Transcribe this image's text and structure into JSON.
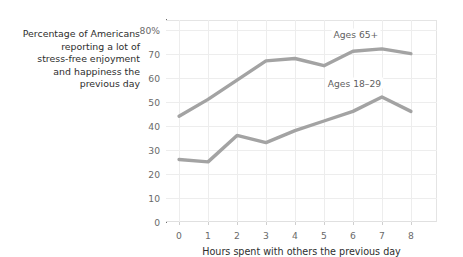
{
  "caption": "Percentage of Americans\nreporting a lot of\nstress-free enjoyment\nand happiness the\nprevious day",
  "axes": {
    "ylabel": "",
    "xlabel": "Hours spent with others the previous day",
    "yticks": [
      "0",
      "10",
      "20",
      "30",
      "40",
      "50",
      "60",
      "70",
      "80%"
    ],
    "xticks": [
      "0",
      "1",
      "2",
      "3",
      "4",
      "5",
      "6",
      "7",
      "8"
    ]
  },
  "annotations": {
    "series_65_label": "Ages 65+",
    "series_18_label": "Ages 18–29"
  },
  "colors": {
    "line": "#a3a3a3",
    "grid": "#ededed",
    "spine": "#6e6e6e",
    "text": "#2e2e2e",
    "tick_text": "#6a6a6a"
  },
  "chart_data": {
    "type": "line",
    "title": "",
    "subtitle": "",
    "xlabel": "Hours spent with others the previous day",
    "ylabel": "Percentage of Americans reporting a lot of stress-free enjoyment and happiness the previous day",
    "x": [
      0,
      1,
      2,
      3,
      4,
      5,
      6,
      7,
      8
    ],
    "xlim": [
      -0.45,
      8.9
    ],
    "ylim": [
      0,
      84
    ],
    "yticks": [
      0,
      10,
      20,
      30,
      40,
      50,
      60,
      70,
      80
    ],
    "xticks": [
      0,
      1,
      2,
      3,
      4,
      5,
      6,
      7,
      8
    ],
    "grid": true,
    "legend": "inline-annotations",
    "series": [
      {
        "name": "Ages 65+",
        "values": [
          44,
          51,
          59,
          67,
          68,
          65,
          71,
          72,
          70
        ],
        "color": "#a3a3a3",
        "label_x": 6.1,
        "label_y": 78
      },
      {
        "name": "Ages 18–29",
        "values": [
          26,
          25,
          36,
          33,
          38,
          42,
          46,
          52,
          46
        ],
        "color": "#a3a3a3",
        "label_x": 6.05,
        "label_y": 58
      }
    ]
  }
}
